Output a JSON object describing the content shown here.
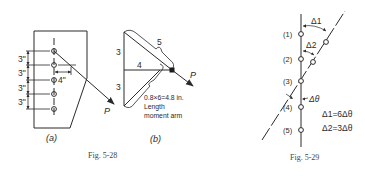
{
  "figures": [
    {
      "caption": "Fig. 5-28",
      "panels": [
        {
          "id": "a",
          "label": "(a)",
          "bolt_count": 5,
          "spacing_labels": [
            "3\"",
            "3\"",
            "3\"",
            "3\""
          ],
          "offset_label": "4\"",
          "load_label": "P"
        },
        {
          "id": "b",
          "label": "(b)",
          "side_labels": {
            "upper_vertical": "3",
            "lower_vertical": "3",
            "horizontal": "4",
            "hypotenuse": "5"
          },
          "load_label": "P",
          "annotation_line1": "0.8×6=4.8 in.",
          "annotation_line2": "Length",
          "annotation_line3": "moment arm"
        }
      ]
    },
    {
      "caption": "Fig. 5-29",
      "bolt_labels": [
        "(1)",
        "(2)",
        "(3)",
        "(4)",
        "(5)"
      ],
      "delta1_label": "Δ1",
      "delta2_label": "Δ2",
      "dtheta_label": "Δθ",
      "equation1": "Δ1=6Δθ",
      "equation2": "Δ2=3Δθ"
    }
  ],
  "colors": {
    "ink": "#2a2a2a",
    "caption": "#444444",
    "background": "#ffffff"
  }
}
